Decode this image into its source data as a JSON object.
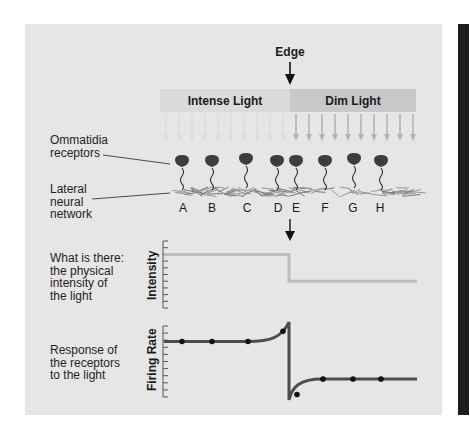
{
  "edge_label": "Edge",
  "light_bands": {
    "intense": "Intense Light",
    "dim": "Dim Light"
  },
  "labels": {
    "ommatidia": [
      "Ommatidia",
      "receptors"
    ],
    "lateral": [
      "Lateral",
      "neural",
      "network"
    ],
    "what_is_there": [
      "What is there:",
      "the physical",
      "intensity of",
      "the light"
    ],
    "response": [
      "Response of",
      "the receptors",
      "to the light"
    ]
  },
  "receptors": [
    "A",
    "B",
    "C",
    "D",
    "E",
    "F",
    "G",
    "H"
  ],
  "axes": {
    "intensity": "Intensity",
    "firing_rate": "Firing Rate"
  },
  "colors": {
    "panel": "#e6e6e6",
    "intense_band": "#dadada",
    "dim_band": "#c8c8c8",
    "intensity_line": "#bdbdbd",
    "firing_line": "#4d4d4d",
    "receptor": "#3d3d3d",
    "side_bar": "#1e1e1e"
  },
  "chart_data": [
    {
      "type": "line",
      "title": "What is there: the physical intensity of the light",
      "ylabel": "Intensity",
      "xlabel": "",
      "note": "step function: high under intense light, drops at edge to low under dim light",
      "x": [
        "start",
        "edge",
        "edge",
        "end"
      ],
      "series": [
        {
          "name": "Intensity",
          "values": [
            0.8,
            0.8,
            0.4,
            0.4
          ]
        }
      ],
      "ylim": [
        0,
        1
      ],
      "ticks": 11
    },
    {
      "type": "line",
      "title": "Response of the receptors to the light",
      "ylabel": "Firing Rate",
      "xlabel": "",
      "note": "lateral inhibition: overshoot just before edge (D), undershoot just after edge (E)",
      "points": [
        {
          "receptor": "A",
          "value": 0.75
        },
        {
          "receptor": "B",
          "value": 0.75
        },
        {
          "receptor": "C",
          "value": 0.75
        },
        {
          "receptor": "D",
          "value": 0.88
        },
        {
          "receptor": "E",
          "value": 0.07
        },
        {
          "receptor": "F",
          "value": 0.27
        },
        {
          "receptor": "G",
          "value": 0.27
        },
        {
          "receptor": "H",
          "value": 0.27
        }
      ],
      "edge_peak": 1.0,
      "edge_trough": 0.0,
      "ylim": [
        0,
        1
      ],
      "ticks": 11
    }
  ]
}
